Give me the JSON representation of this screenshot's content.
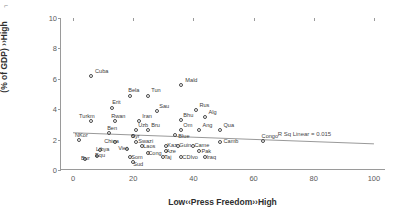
{
  "chart_data": {
    "type": "scatter",
    "title": "",
    "xlabel": "Low‹‹Press Freedom››High",
    "ylabel": "Low ‹‹Public health expenditure\n(% of GDP) ››High",
    "xlim": [
      -4,
      104
    ],
    "ylim": [
      0,
      10
    ],
    "xticks": [
      0,
      20,
      40,
      60,
      80,
      100
    ],
    "yticks": [
      0,
      2,
      4,
      6,
      8,
      10
    ],
    "grid": false,
    "legend": null,
    "annotations": [
      {
        "text": "R Sq Linear = 0.015",
        "x": 68,
        "y": 2.55
      }
    ],
    "trendline": {
      "type": "linear",
      "r_squared": 0.015,
      "x0": 0,
      "y0": 2.45,
      "x1": 100,
      "y1": 1.72
    },
    "points": [
      {
        "label": "Cuba",
        "x": 6,
        "y": 6.2,
        "lx": 4,
        "ly": -5
      },
      {
        "label": "Mald",
        "x": 36,
        "y": 5.6,
        "lx": 4,
        "ly": -5
      },
      {
        "label": "Bela",
        "x": 19,
        "y": 4.85,
        "lx": -2,
        "ly": -6
      },
      {
        "label": "Tun",
        "x": 25,
        "y": 4.9,
        "lx": 3,
        "ly": -6
      },
      {
        "label": "Erit",
        "x": 13,
        "y": 4.05,
        "lx": 0,
        "ly": -6
      },
      {
        "label": "Rus",
        "x": 41,
        "y": 3.95,
        "lx": 3,
        "ly": -5
      },
      {
        "label": "Sau",
        "x": 28,
        "y": 3.85,
        "lx": 2,
        "ly": -5
      },
      {
        "label": "Turkm",
        "x": 6,
        "y": 3.2,
        "lx": -12,
        "ly": -5
      },
      {
        "label": "Rwan",
        "x": 14,
        "y": 3.2,
        "lx": -4,
        "ly": -5
      },
      {
        "label": "Iran",
        "x": 22,
        "y": 3.25,
        "lx": 3,
        "ly": -5
      },
      {
        "label": "Bhu",
        "x": 36,
        "y": 3.3,
        "lx": 2,
        "ly": -5
      },
      {
        "label": "Alg",
        "x": 44,
        "y": 3.5,
        "lx": 3,
        "ly": -5
      },
      {
        "label": "Uzb",
        "x": 21,
        "y": 2.6,
        "lx": 2,
        "ly": -5
      },
      {
        "label": "Bru",
        "x": 25,
        "y": 2.65,
        "lx": 3,
        "ly": -5
      },
      {
        "label": "Om",
        "x": 36,
        "y": 2.65,
        "lx": 2,
        "ly": -5
      },
      {
        "label": "Ang",
        "x": 42,
        "y": 2.6,
        "lx": 3,
        "ly": -5
      },
      {
        "label": "Qua",
        "x": 49,
        "y": 2.6,
        "lx": 3,
        "ly": -5
      },
      {
        "label": "Ben",
        "x": 12,
        "y": 2.45,
        "lx": -2,
        "ly": -5
      },
      {
        "label": "Syr",
        "x": 20,
        "y": 2.25,
        "lx": -2,
        "ly": 0
      },
      {
        "label": "Blue",
        "x": 34,
        "y": 2.3,
        "lx": 3,
        "ly": 1
      },
      {
        "label": "NKor",
        "x": 2,
        "y": 1.95,
        "lx": -4,
        "ly": -5
      },
      {
        "label": "China",
        "x": 14,
        "y": 1.85,
        "lx": -11,
        "ly": -1
      },
      {
        "label": "Swazi",
        "x": 21,
        "y": 1.85,
        "lx": 2,
        "ly": -1
      },
      {
        "label": "Camb",
        "x": 49,
        "y": 1.85,
        "lx": 3,
        "ly": -1
      },
      {
        "label": "Congo",
        "x": 63,
        "y": 1.9,
        "lx": -1,
        "ly": -5
      },
      {
        "label": "Laos",
        "x": 23,
        "y": 1.55,
        "lx": 1,
        "ly": 0
      },
      {
        "label": "Kaz",
        "x": 31,
        "y": 1.55,
        "lx": 1,
        "ly": -1
      },
      {
        "label": "Guin",
        "x": 35,
        "y": 1.6,
        "lx": 1,
        "ly": -1
      },
      {
        "label": "Came",
        "x": 40,
        "y": 1.55,
        "lx": 1,
        "ly": -1
      },
      {
        "label": "Viet",
        "x": 18,
        "y": 1.35,
        "lx": -9,
        "ly": -1
      },
      {
        "label": "Libya",
        "x": 9,
        "y": 1.3,
        "lx": -4,
        "ly": -1
      },
      {
        "label": "Aze",
        "x": 31,
        "y": 1.25,
        "lx": 0,
        "ly": 0
      },
      {
        "label": "Pak",
        "x": 42,
        "y": 1.25,
        "lx": 2,
        "ly": 0
      },
      {
        "label": "Cong",
        "x": 25,
        "y": 1.1,
        "lx": 0,
        "ly": 0
      },
      {
        "label": "Equ",
        "x": 8,
        "y": 0.9,
        "lx": -2,
        "ly": -1
      },
      {
        "label": "Bur",
        "x": 4,
        "y": 0.75,
        "lx": -4,
        "ly": -1
      },
      {
        "label": "Som",
        "x": 19,
        "y": 0.85,
        "lx": 1,
        "ly": 0
      },
      {
        "label": "Taj",
        "x": 30,
        "y": 0.85,
        "lx": 1,
        "ly": 0
      },
      {
        "label": "CDIvo",
        "x": 36,
        "y": 0.85,
        "lx": 1,
        "ly": 0
      },
      {
        "label": "Iraq",
        "x": 44,
        "y": 0.85,
        "lx": 1,
        "ly": 0
      },
      {
        "label": "Sud",
        "x": 20,
        "y": 0.5,
        "lx": 0,
        "ly": 2
      }
    ]
  },
  "corner_mark": "⌐"
}
